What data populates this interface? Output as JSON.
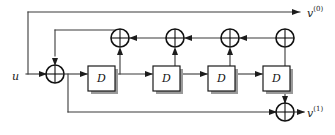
{
  "diagram": {
    "type": "block-diagram",
    "colors": {
      "background": "#ffffff",
      "wire": "#3a3a3a",
      "outline": "#111111",
      "block_fill": "#ffffff",
      "block_shadow": "#9a9a9a"
    },
    "input": {
      "name": "input-u",
      "base": "u",
      "superscript": ""
    },
    "outputs": [
      {
        "name": "output-v0",
        "base": "v",
        "superscript": "(0)",
        "position": "top-right"
      },
      {
        "name": "output-v1",
        "base": "v",
        "superscript": "(1)",
        "position": "bottom-right"
      }
    ],
    "delay_blocks": [
      {
        "label": "D",
        "index": 1
      },
      {
        "label": "D",
        "index": 2
      },
      {
        "label": "D",
        "index": 3
      },
      {
        "label": "D",
        "index": 4
      }
    ],
    "adders": [
      {
        "name": "adder-input",
        "symbol": "+",
        "row": "input"
      },
      {
        "name": "adder-fb-1",
        "symbol": "+",
        "row": "feedback"
      },
      {
        "name": "adder-fb-2",
        "symbol": "+",
        "row": "feedback"
      },
      {
        "name": "adder-fb-3",
        "symbol": "+",
        "row": "feedback"
      },
      {
        "name": "adder-fb-4",
        "symbol": "+",
        "row": "feedback"
      },
      {
        "name": "adder-output",
        "symbol": "+",
        "row": "output"
      }
    ],
    "signal_flow": {
      "forward_direction": "left-to-right",
      "feedback_direction": "right-to-left"
    }
  }
}
